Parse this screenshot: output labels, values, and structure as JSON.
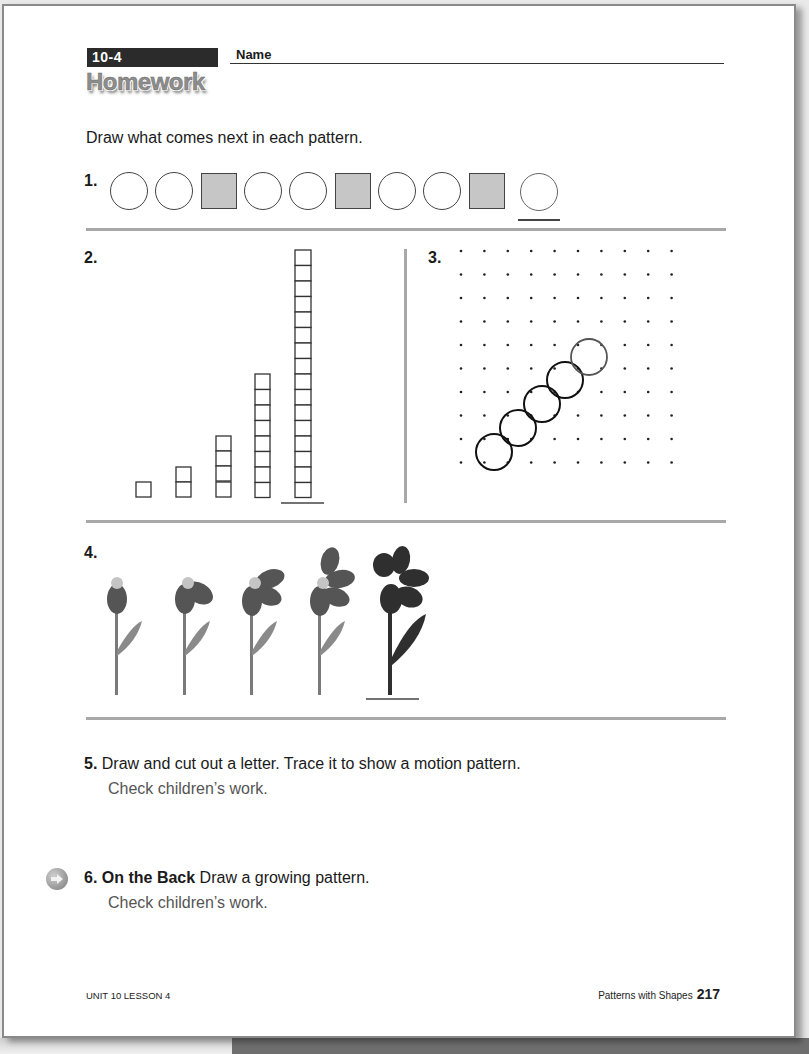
{
  "header": {
    "lesson_code": "10-4",
    "name_label": "Name",
    "title": "Homework"
  },
  "instructions": "Draw what comes next in each pattern.",
  "problems": {
    "p1": {
      "number": "1.",
      "sequence": [
        "circle",
        "circle",
        "square",
        "circle",
        "circle",
        "square",
        "circle",
        "circle",
        "square"
      ],
      "answer": "circle"
    },
    "p2": {
      "number": "2.",
      "columns": [
        1,
        2,
        4,
        8
      ],
      "answer": 16
    },
    "p3": {
      "number": "3.",
      "grid_cols": 10,
      "grid_rows": 10,
      "circles_shown": 4,
      "answer_circle": 1
    },
    "p4": {
      "number": "4.",
      "flowers": [
        {
          "petals": 1,
          "stage": "bud"
        },
        {
          "petals": 2,
          "stage": "opening"
        },
        {
          "petals": 3,
          "stage": "opening"
        },
        {
          "petals": 4,
          "stage": "opening"
        },
        {
          "petals": 5,
          "stage": "answer"
        }
      ]
    },
    "p5": {
      "number": "5.",
      "text": "Draw and cut out a letter. Trace it to show a motion pattern.",
      "answer": "Check children’s work."
    },
    "p6": {
      "number": "6.",
      "label": "On the Back",
      "text": "Draw a growing pattern.",
      "answer": "Check children’s work.",
      "icon": "arrow-right-icon"
    }
  },
  "footer": {
    "left": "UNIT 10 LESSON 4",
    "right_label": "Patterns with Shapes",
    "page_number": "217"
  },
  "colors": {
    "lesson_bar": "#2b2b2b",
    "rule": "#a8a8a8",
    "square_fill": "#c6c6c6",
    "flower_light": "#6e6e6e",
    "flower_dark": "#2f2f2f",
    "answer_text": "#555555"
  }
}
